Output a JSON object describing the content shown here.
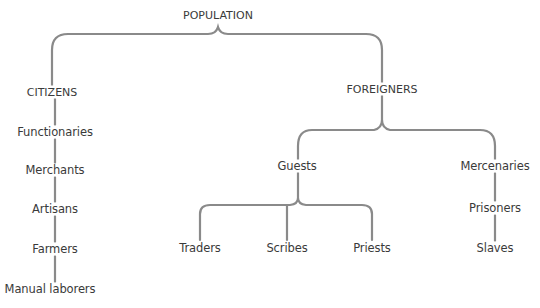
{
  "diagram": {
    "title": "POPULATION",
    "line_color": "#8a8a8a",
    "text_color": "#3a3a3a",
    "root": {
      "label": "POPULATION",
      "children": [
        {
          "label": "CITIZENS",
          "chain": [
            "Functionaries",
            "Merchants",
            "Artisans",
            "Farmers",
            "Manual laborers"
          ]
        },
        {
          "label": "FOREIGNERS",
          "children": [
            {
              "label": "Guests",
              "children": [
                "Traders",
                "Scribes",
                "Priests"
              ]
            },
            {
              "label": "Mercenaries",
              "chain": [
                "Prisoners",
                "Slaves"
              ]
            }
          ]
        }
      ]
    },
    "nodes": {
      "population": "POPULATION",
      "citizens": "CITIZENS",
      "functionaries": "Functionaries",
      "merchants": "Merchants",
      "artisans": "Artisans",
      "farmers": "Farmers",
      "manual_laborers": "Manual laborers",
      "foreigners": "FOREIGNERS",
      "guests": "Guests",
      "traders": "Traders",
      "scribes": "Scribes",
      "priests": "Priests",
      "mercenaries": "Mercenaries",
      "prisoners": "Prisoners",
      "slaves": "Slaves"
    }
  }
}
